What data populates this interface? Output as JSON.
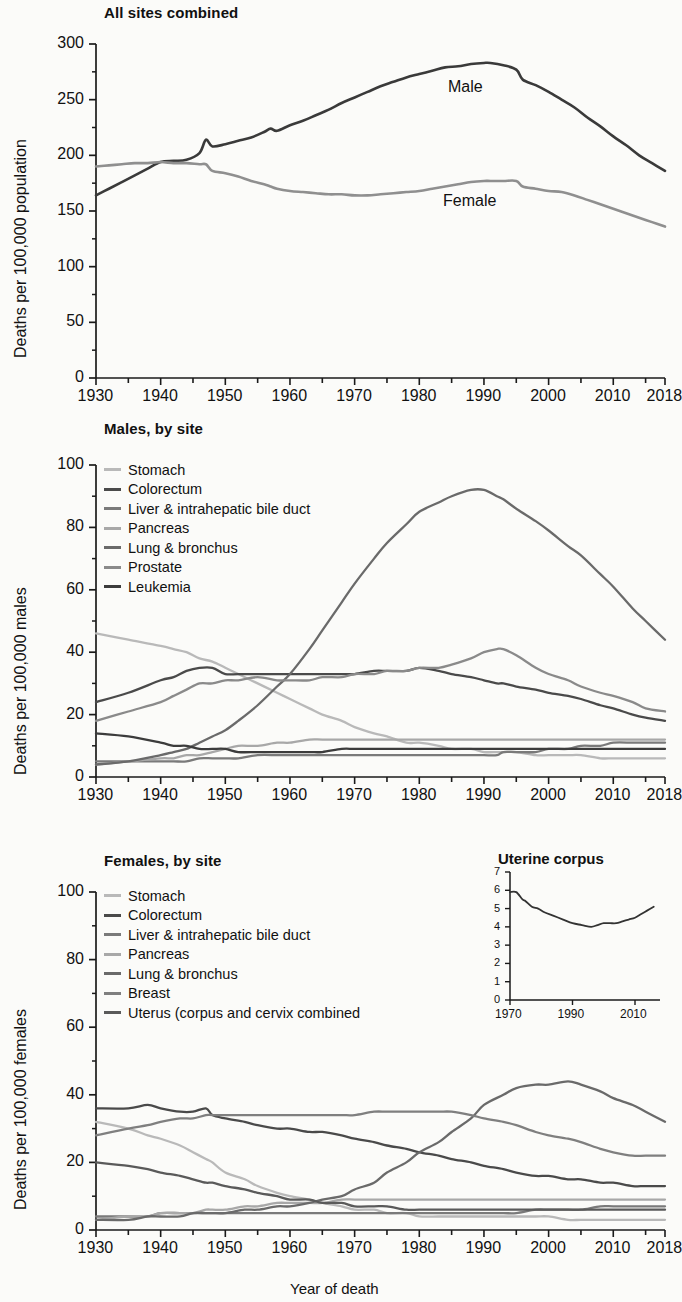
{
  "figure": {
    "xaxis_caption": "Year of death"
  },
  "panels": {
    "all": {
      "title": "All sites combined",
      "ylabel": "Deaths per 100,000 population",
      "yticks": [
        "0",
        "50",
        "100",
        "150",
        "200",
        "250",
        "300"
      ],
      "xticks": [
        "1930",
        "1940",
        "1950",
        "1960",
        "1970",
        "1980",
        "1990",
        "2000",
        "2010",
        "2018"
      ],
      "annotations": {
        "male": "Male",
        "female": "Female"
      }
    },
    "male": {
      "title": "Males, by site",
      "ylabel": "Deaths per 100,000 males",
      "yticks": [
        "0",
        "20",
        "40",
        "60",
        "80",
        "100"
      ],
      "xticks": [
        "1930",
        "1940",
        "1950",
        "1960",
        "1970",
        "1980",
        "1990",
        "2000",
        "2010",
        "2018"
      ],
      "legend": [
        "Stomach",
        "Colorectum",
        "Liver & intrahepatic bile duct",
        "Pancreas",
        "Lung & bronchus",
        "Prostate",
        "Leukemia"
      ]
    },
    "female": {
      "title": "Females, by site",
      "ylabel": "Deaths per 100,000 females",
      "yticks": [
        "0",
        "20",
        "40",
        "60",
        "80",
        "100"
      ],
      "xticks": [
        "1930",
        "1940",
        "1950",
        "1960",
        "1970",
        "1980",
        "1990",
        "2000",
        "2010",
        "2018"
      ],
      "legend": [
        "Stomach",
        "Colorectum",
        "Liver & intrahepatic bile duct",
        "Pancreas",
        "Lung & bronchus",
        "Breast",
        "Uterus (corpus and cervix combined"
      ],
      "inset": {
        "title": "Uterine corpus",
        "yticks": [
          "0",
          "1",
          "2",
          "3",
          "4",
          "5",
          "6",
          "7"
        ],
        "xticks": [
          "1970",
          "1990",
          "2010"
        ]
      }
    }
  },
  "colors": {
    "stomach": "#b9b9b9",
    "colorectum": "#4a4a4a",
    "liver": "#7a7a7a",
    "pancreas": "#a8a8a8",
    "lung": "#6a6a6a",
    "prostate": "#8a8a8a",
    "leukemia": "#3c3c3c",
    "breast": "#7f7f7f",
    "uterus": "#5a5a5a",
    "male": "#3a3a3a",
    "female": "#8f8f8f",
    "axis": "#1a1a1a"
  },
  "chart_data": [
    {
      "type": "line",
      "id": "all-sites-combined",
      "title": "All sites combined",
      "xlabel": "Year of death",
      "ylabel": "Deaths per 100,000 population",
      "xlim": [
        1930,
        2018
      ],
      "ylim": [
        0,
        300
      ],
      "ytick_step": 50,
      "minor_ytick_step": 25,
      "xtick_step": 10,
      "minor_xtick_step": 5,
      "grid": false,
      "legend_position": "inline-annotation",
      "x": [
        1930,
        1932,
        1934,
        1936,
        1938,
        1940,
        1942,
        1944,
        1946,
        1947,
        1948,
        1950,
        1952,
        1954,
        1956,
        1957,
        1958,
        1960,
        1962,
        1964,
        1966,
        1968,
        1970,
        1972,
        1974,
        1976,
        1978,
        1980,
        1982,
        1984,
        1986,
        1988,
        1990,
        1991,
        1993,
        1995,
        1996,
        1998,
        2000,
        2002,
        2004,
        2006,
        2008,
        2010,
        2012,
        2014,
        2016,
        2018
      ],
      "series": [
        {
          "name": "Male",
          "color": "#3a3a3a",
          "values": [
            164,
            170,
            176,
            182,
            188,
            194,
            195,
            196,
            202,
            214,
            208,
            210,
            213,
            216,
            221,
            224,
            222,
            227,
            231,
            236,
            241,
            247,
            252,
            257,
            262,
            266,
            270,
            273,
            276,
            279,
            280,
            282,
            283,
            283,
            281,
            277,
            268,
            263,
            257,
            250,
            243,
            234,
            226,
            217,
            209,
            200,
            193,
            186
          ]
        },
        {
          "name": "Female",
          "color": "#8f8f8f",
          "values": [
            190,
            191,
            192,
            193,
            193,
            194,
            193,
            193,
            192,
            192,
            186,
            184,
            181,
            177,
            174,
            172,
            170,
            168,
            167,
            166,
            165,
            165,
            164,
            164,
            165,
            166,
            167,
            168,
            170,
            172,
            174,
            176,
            177,
            177,
            177,
            177,
            172,
            170,
            168,
            167,
            164,
            160,
            156,
            152,
            148,
            144,
            140,
            136
          ]
        }
      ]
    },
    {
      "type": "line",
      "id": "males-by-site",
      "title": "Males, by site",
      "xlabel": "Year of death",
      "ylabel": "Deaths per 100,000 males",
      "xlim": [
        1930,
        2018
      ],
      "ylim": [
        0,
        100
      ],
      "ytick_step": 20,
      "minor_ytick_step": 10,
      "xtick_step": 10,
      "minor_xtick_step": 5,
      "grid": false,
      "legend_position": "upper-left",
      "x": [
        1930,
        1935,
        1940,
        1942,
        1944,
        1946,
        1948,
        1950,
        1952,
        1955,
        1958,
        1960,
        1963,
        1965,
        1968,
        1970,
        1973,
        1975,
        1978,
        1980,
        1983,
        1985,
        1988,
        1990,
        1992,
        1993,
        1995,
        1998,
        2000,
        2003,
        2005,
        2008,
        2010,
        2013,
        2015,
        2018
      ],
      "series": [
        {
          "name": "Stomach",
          "color": "#b9b9b9",
          "values": [
            46,
            44,
            42,
            41,
            40,
            38,
            37,
            35,
            33,
            30,
            27,
            25,
            22,
            20,
            18,
            16,
            14,
            13,
            11,
            11,
            10,
            9,
            9,
            8,
            8,
            8,
            8,
            7,
            7,
            7,
            7,
            6,
            6,
            6,
            6,
            6
          ]
        },
        {
          "name": "Colorectum",
          "color": "#4a4a4a",
          "values": [
            24,
            27,
            31,
            32,
            34,
            35,
            35,
            33,
            33,
            33,
            33,
            33,
            33,
            33,
            33,
            33,
            34,
            34,
            34,
            35,
            34,
            33,
            32,
            31,
            30,
            30,
            29,
            28,
            27,
            26,
            25,
            23,
            22,
            20,
            19,
            18
          ]
        },
        {
          "name": "Liver & intrahepatic bile duct",
          "color": "#7a7a7a",
          "values": [
            5,
            5,
            5,
            5,
            5,
            6,
            6,
            6,
            6,
            7,
            7,
            7,
            7,
            7,
            7,
            7,
            7,
            7,
            7,
            7,
            7,
            7,
            7,
            7,
            7,
            8,
            8,
            8,
            9,
            9,
            10,
            10,
            11,
            11,
            11,
            11
          ]
        },
        {
          "name": "Pancreas",
          "color": "#a8a8a8",
          "values": [
            4,
            5,
            6,
            6,
            7,
            7,
            8,
            9,
            10,
            10,
            11,
            11,
            12,
            12,
            12,
            12,
            12,
            12,
            12,
            12,
            12,
            12,
            12,
            12,
            12,
            12,
            12,
            12,
            12,
            12,
            12,
            12,
            12,
            12,
            12,
            12
          ]
        },
        {
          "name": "Lung & bronchus",
          "color": "#6a6a6a",
          "values": [
            4,
            5,
            7,
            8,
            9,
            11,
            13,
            15,
            18,
            23,
            29,
            33,
            41,
            47,
            56,
            62,
            70,
            75,
            81,
            85,
            88,
            90,
            92,
            92,
            90,
            89,
            86,
            82,
            79,
            74,
            71,
            65,
            61,
            54,
            50,
            44
          ]
        },
        {
          "name": "Prostate",
          "color": "#8a8a8a",
          "values": [
            18,
            21,
            24,
            26,
            28,
            30,
            30,
            31,
            31,
            32,
            31,
            31,
            31,
            32,
            32,
            33,
            33,
            34,
            34,
            35,
            35,
            36,
            38,
            40,
            41,
            41,
            39,
            35,
            33,
            31,
            29,
            27,
            26,
            24,
            22,
            21
          ]
        },
        {
          "name": "Leukemia",
          "color": "#3c3c3c",
          "values": [
            14,
            13,
            11,
            10,
            10,
            9,
            9,
            9,
            8,
            8,
            8,
            8,
            8,
            8,
            9,
            9,
            9,
            9,
            9,
            9,
            9,
            9,
            9,
            9,
            9,
            9,
            9,
            9,
            9,
            9,
            9,
            9,
            9,
            9,
            9,
            9
          ]
        }
      ]
    },
    {
      "type": "line",
      "id": "females-by-site",
      "title": "Females, by site",
      "xlabel": "Year of death",
      "ylabel": "Deaths per 100,000 females",
      "xlim": [
        1930,
        2018
      ],
      "ylim": [
        0,
        100
      ],
      "ytick_step": 20,
      "minor_ytick_step": 10,
      "xtick_step": 10,
      "minor_xtick_step": 5,
      "grid": false,
      "legend_position": "upper-left",
      "x": [
        1930,
        1935,
        1938,
        1940,
        1943,
        1945,
        1947,
        1948,
        1950,
        1953,
        1955,
        1958,
        1960,
        1963,
        1965,
        1968,
        1970,
        1973,
        1975,
        1978,
        1980,
        1983,
        1985,
        1988,
        1990,
        1993,
        1995,
        1998,
        2000,
        2003,
        2005,
        2008,
        2010,
        2013,
        2015,
        2018
      ],
      "series": [
        {
          "name": "Stomach",
          "color": "#b9b9b9",
          "values": [
            32,
            30,
            28,
            27,
            25,
            23,
            21,
            20,
            17,
            15,
            13,
            11,
            10,
            9,
            8,
            7,
            6,
            6,
            5,
            5,
            4,
            4,
            4,
            4,
            4,
            4,
            4,
            4,
            4,
            3,
            3,
            3,
            3,
            3,
            3,
            3
          ]
        },
        {
          "name": "Colorectum",
          "color": "#4a4a4a",
          "values": [
            36,
            36,
            37,
            36,
            35,
            35,
            36,
            34,
            33,
            32,
            31,
            30,
            30,
            29,
            29,
            28,
            27,
            26,
            25,
            24,
            23,
            22,
            21,
            20,
            19,
            18,
            17,
            16,
            16,
            15,
            15,
            14,
            14,
            13,
            13,
            13
          ]
        },
        {
          "name": "Liver & intrahepatic bile duct",
          "color": "#7a7a7a",
          "values": [
            4,
            4,
            4,
            5,
            5,
            5,
            5,
            5,
            5,
            5,
            5,
            5,
            5,
            5,
            5,
            5,
            5,
            5,
            5,
            5,
            5,
            5,
            5,
            5,
            5,
            5,
            5,
            6,
            6,
            6,
            6,
            7,
            7,
            7,
            7,
            7
          ]
        },
        {
          "name": "Pancreas",
          "color": "#a8a8a8",
          "values": [
            3,
            4,
            4,
            5,
            5,
            5,
            6,
            6,
            6,
            7,
            7,
            8,
            8,
            8,
            8,
            9,
            9,
            9,
            9,
            9,
            9,
            9,
            9,
            9,
            9,
            9,
            9,
            9,
            9,
            9,
            9,
            9,
            9,
            9,
            9,
            9
          ]
        },
        {
          "name": "Lung & bronchus",
          "color": "#6a6a6a",
          "values": [
            3,
            3,
            4,
            4,
            4,
            5,
            5,
            5,
            5,
            6,
            6,
            7,
            7,
            8,
            9,
            10,
            12,
            14,
            17,
            20,
            23,
            26,
            29,
            33,
            37,
            40,
            42,
            43,
            43,
            44,
            43,
            41,
            39,
            37,
            35,
            32
          ]
        },
        {
          "name": "Breast",
          "color": "#7f7f7f",
          "values": [
            28,
            30,
            31,
            32,
            33,
            33,
            34,
            34,
            34,
            34,
            34,
            34,
            34,
            34,
            34,
            34,
            34,
            35,
            35,
            35,
            35,
            35,
            35,
            34,
            33,
            32,
            31,
            29,
            28,
            27,
            26,
            24,
            23,
            22,
            22,
            22
          ]
        },
        {
          "name": "Uterus (corpus and cervix combined",
          "color": "#5a5a5a",
          "values": [
            20,
            19,
            18,
            17,
            16,
            15,
            14,
            14,
            13,
            12,
            11,
            10,
            9,
            9,
            8,
            8,
            7,
            7,
            7,
            6,
            6,
            6,
            6,
            6,
            6,
            6,
            6,
            6,
            6,
            6,
            6,
            6,
            6,
            6,
            6,
            6
          ]
        }
      ]
    },
    {
      "type": "line",
      "id": "uterine-corpus-inset",
      "title": "Uterine corpus",
      "xlim": [
        1970,
        2018
      ],
      "ylim": [
        0,
        7
      ],
      "ytick_step": 1,
      "xtick_step": 20,
      "grid": false,
      "x": [
        1970,
        1972,
        1974,
        1975,
        1977,
        1979,
        1981,
        1984,
        1987,
        1990,
        1993,
        1996,
        1998,
        2000,
        2002,
        2004,
        2006,
        2008,
        2010,
        2012,
        2014,
        2016
      ],
      "series": [
        {
          "name": "Uterine corpus",
          "color": "#333333",
          "values": [
            5.9,
            5.9,
            5.5,
            5.4,
            5.1,
            5.0,
            4.8,
            4.6,
            4.4,
            4.2,
            4.1,
            4.0,
            4.1,
            4.2,
            4.2,
            4.2,
            4.3,
            4.4,
            4.5,
            4.7,
            4.9,
            5.1
          ]
        }
      ]
    }
  ]
}
